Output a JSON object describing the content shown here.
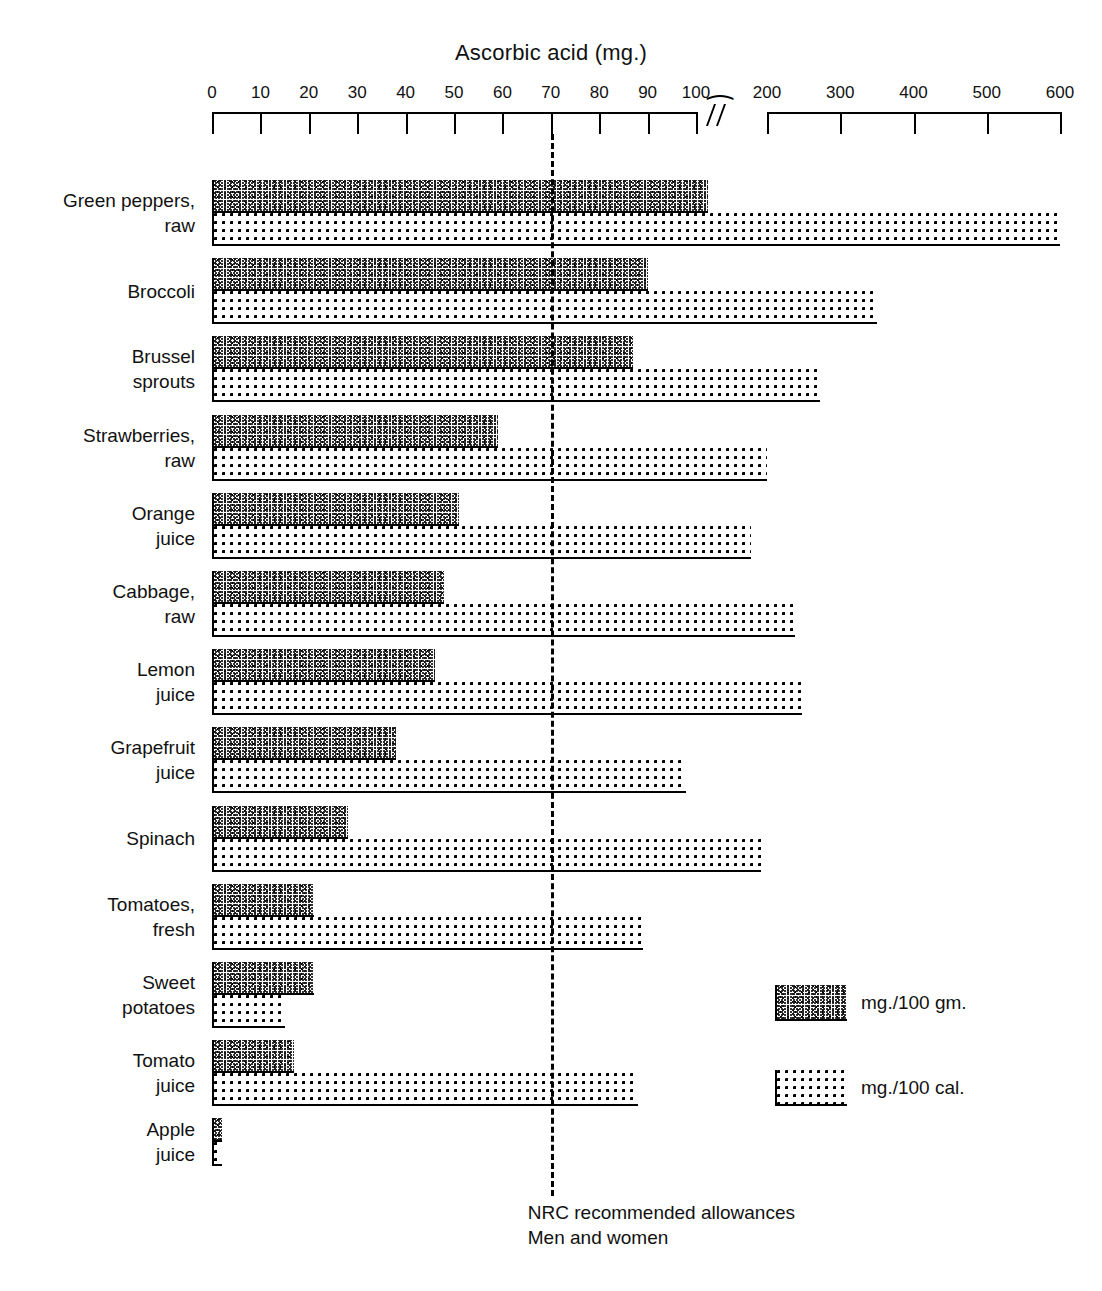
{
  "chart_data": {
    "type": "bar",
    "orientation": "horizontal",
    "title": "Ascorbic acid (mg.)",
    "xlabel": "Ascorbic acid (mg.)",
    "ylabel": "",
    "grid": false,
    "legend_position": "right-lower",
    "axis": {
      "tick_labels": [
        "0",
        "10",
        "20",
        "30",
        "40",
        "50",
        "60",
        "70",
        "80",
        "90",
        "100",
        "200",
        "300",
        "400",
        "500",
        "600"
      ],
      "tick_values": [
        0,
        10,
        20,
        30,
        40,
        50,
        60,
        70,
        80,
        90,
        100,
        200,
        300,
        400,
        500,
        600
      ],
      "has_break": true,
      "break_after": 100,
      "xlim": [
        0,
        600
      ]
    },
    "legend": [
      {
        "key": "mg_per_100gm",
        "label": "mg./100 gm.",
        "pattern": "dense-speckle"
      },
      {
        "key": "mg_per_100cal",
        "label": "mg./100 cal.",
        "pattern": "open-dots"
      }
    ],
    "reference_line": {
      "value": 70,
      "label_line1": "NRC recommended allowances",
      "label_line2": "Men and women",
      "style": "dashed"
    },
    "categories": [
      "Green peppers,\nraw",
      "Broccoli",
      "Brussel\nsprouts",
      "Strawberries,\nraw",
      "Orange\njuice",
      "Cabbage,\nraw",
      "Lemon\njuice",
      "Grapefruit\njuice",
      "Spinach",
      "Tomatoes,\nfresh",
      "Sweet\npotatoes",
      "Tomato\njuice",
      "Apple\njuice"
    ],
    "series": [
      {
        "name": "mg./100 gm.",
        "values": [
          120,
          90,
          87,
          59,
          51,
          48,
          46,
          38,
          28,
          21,
          21,
          17,
          2
        ]
      },
      {
        "name": "mg./100 cal.",
        "values": [
          600,
          350,
          272,
          200,
          178,
          238,
          248,
          98,
          192,
          89,
          15,
          88,
          2
        ]
      }
    ],
    "rows": [
      {
        "label_line1": "Green peppers,",
        "label_line2": "raw",
        "gm": 120,
        "cal": 600
      },
      {
        "label_line1": "Broccoli",
        "label_line2": "",
        "gm": 90,
        "cal": 350
      },
      {
        "label_line1": "Brussel",
        "label_line2": "sprouts",
        "gm": 87,
        "cal": 272
      },
      {
        "label_line1": "Strawberries,",
        "label_line2": "raw",
        "gm": 59,
        "cal": 200
      },
      {
        "label_line1": "Orange",
        "label_line2": "juice",
        "gm": 51,
        "cal": 178
      },
      {
        "label_line1": "Cabbage,",
        "label_line2": "raw",
        "gm": 48,
        "cal": 238
      },
      {
        "label_line1": "Lemon",
        "label_line2": "juice",
        "gm": 46,
        "cal": 248
      },
      {
        "label_line1": "Grapefruit",
        "label_line2": "juice",
        "gm": 38,
        "cal": 98
      },
      {
        "label_line1": "Spinach",
        "label_line2": "",
        "gm": 28,
        "cal": 192
      },
      {
        "label_line1": "Tomatoes,",
        "label_line2": "fresh",
        "gm": 21,
        "cal": 89
      },
      {
        "label_line1": "Sweet",
        "label_line2": "potatoes",
        "gm": 21,
        "cal": 15
      },
      {
        "label_line1": "Tomato",
        "label_line2": "juice",
        "gm": 17,
        "cal": 88
      },
      {
        "label_line1": "Apple",
        "label_line2": "juice",
        "gm": 2,
        "cal": 2
      }
    ],
    "colors": {
      "ink": "#000000",
      "background": "#ffffff"
    }
  }
}
